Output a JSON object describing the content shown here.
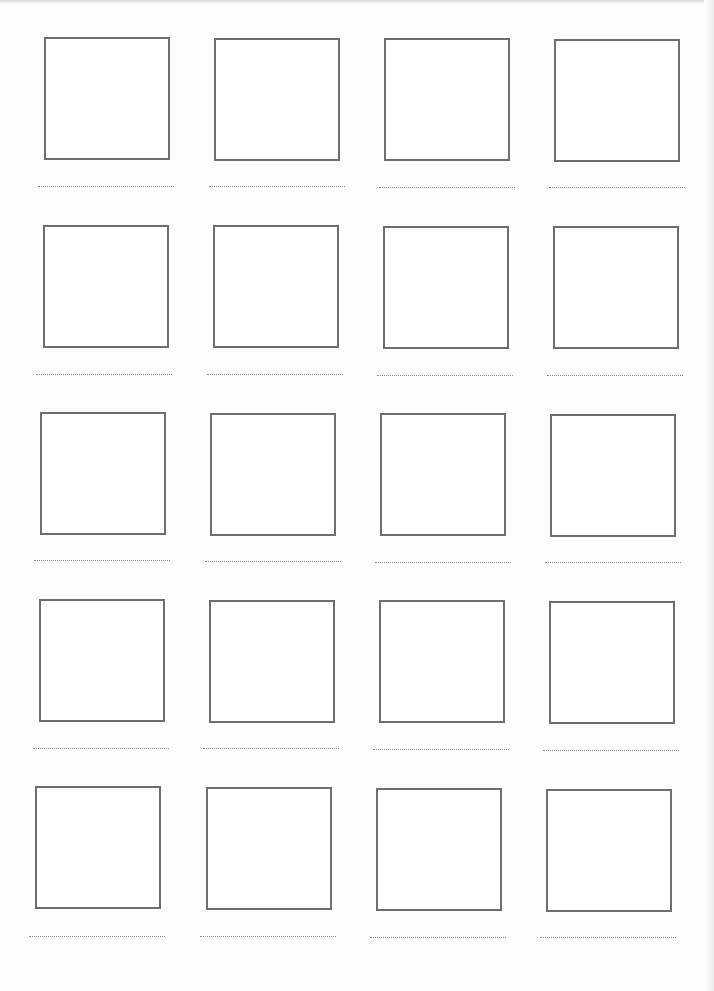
{
  "worksheet": {
    "rows": 5,
    "columns": 4,
    "cells": [
      {
        "box": [
          44,
          37
        ],
        "line": [
          38,
          186
        ]
      },
      {
        "box": [
          214,
          38
        ],
        "line": [
          209,
          186
        ]
      },
      {
        "box": [
          384,
          38
        ],
        "line": [
          379,
          187
        ]
      },
      {
        "box": [
          554,
          39
        ],
        "line": [
          549,
          187
        ]
      },
      {
        "box": [
          43,
          225
        ],
        "line": [
          36,
          374
        ]
      },
      {
        "box": [
          213,
          225
        ],
        "line": [
          207,
          374
        ]
      },
      {
        "box": [
          383,
          226
        ],
        "line": [
          377,
          375
        ]
      },
      {
        "box": [
          553,
          226
        ],
        "line": [
          547,
          375
        ]
      },
      {
        "box": [
          40,
          412
        ],
        "line": [
          34,
          560
        ]
      },
      {
        "box": [
          210,
          413
        ],
        "line": [
          205,
          561
        ]
      },
      {
        "box": [
          380,
          413
        ],
        "line": [
          375,
          562
        ]
      },
      {
        "box": [
          550,
          414
        ],
        "line": [
          545,
          562
        ]
      },
      {
        "box": [
          39,
          599
        ],
        "line": [
          33,
          748
        ]
      },
      {
        "box": [
          209,
          600
        ],
        "line": [
          203,
          748
        ]
      },
      {
        "box": [
          379,
          600
        ],
        "line": [
          373,
          749
        ]
      },
      {
        "box": [
          549,
          601
        ],
        "line": [
          543,
          750
        ]
      },
      {
        "box": [
          35,
          786
        ],
        "line": [
          29,
          936
        ]
      },
      {
        "box": [
          206,
          787
        ],
        "line": [
          200,
          936
        ]
      },
      {
        "box": [
          376,
          788
        ],
        "line": [
          370,
          937
        ]
      },
      {
        "box": [
          546,
          789
        ],
        "line": [
          540,
          937
        ]
      }
    ]
  }
}
